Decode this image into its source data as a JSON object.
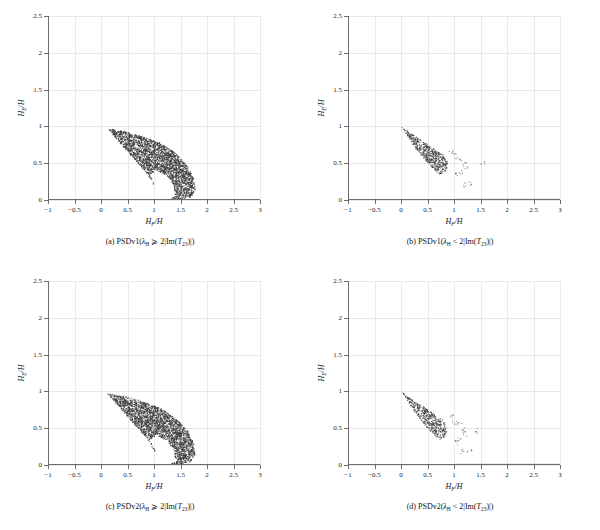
{
  "figure": {
    "panel_count": 4,
    "axes": {
      "xlabel_main": "H",
      "xlabel_sub": "F",
      "xlabel_tail": "/H",
      "ylabel_main": "H",
      "ylabel_sub": "E",
      "ylabel_tail": "/H",
      "xticks": [
        "-1",
        "-0.5",
        "0",
        "0.5",
        "1",
        "1.5",
        "2",
        "2.5",
        "3"
      ],
      "yticks": [
        "0",
        "0.5",
        "1",
        "1.5",
        "2",
        "2.5"
      ],
      "xlim": [
        -1,
        3
      ],
      "ylim": [
        0,
        2.5
      ]
    },
    "colors": {
      "point": "#3a3a3a",
      "axis": "#6d6d6d",
      "grid": "#e9e9e9",
      "background": "#ffffff",
      "text": "#111111"
    },
    "panels": [
      {
        "id": "a",
        "caption_label": "(a)",
        "caption_method": "PSDv1(",
        "caption_lambda": "λ",
        "caption_lambda_sub": "H",
        "caption_relation": " ⩾ 2|Im(",
        "caption_T": "T",
        "caption_T_sub": "23",
        "caption_tail": ")|)",
        "shape": "crescent"
      },
      {
        "id": "b",
        "caption_label": "(b)",
        "caption_method": "PSDv1(",
        "caption_lambda": "λ",
        "caption_lambda_sub": "H",
        "caption_relation": " < 2|Im(",
        "caption_T": "T",
        "caption_T_sub": "23",
        "caption_tail": ")|)",
        "shape": "wedge-with-baseline"
      },
      {
        "id": "c",
        "caption_label": "(c)",
        "caption_method": "PSDv2(",
        "caption_lambda": "λ",
        "caption_lambda_sub": "H",
        "caption_relation": " ⩾ 2|Im(",
        "caption_T": "T",
        "caption_T_sub": "23",
        "caption_tail": ")|)",
        "shape": "crescent"
      },
      {
        "id": "d",
        "caption_label": "(d)",
        "caption_method": "PSDv2(",
        "caption_lambda": "λ",
        "caption_lambda_sub": "H",
        "caption_relation": " < 2|Im(",
        "caption_T": "T",
        "caption_T_sub": "23",
        "caption_tail": ")|)",
        "shape": "wedge-with-baseline"
      }
    ]
  },
  "chart_data": [
    {
      "type": "scatter",
      "panel": "a",
      "title": "(a) PSDv1( λH ⩾ 2|Im(T23)|)",
      "xlabel": "HF/H",
      "ylabel": "HE/H",
      "xlim": [
        -1,
        3
      ],
      "ylim": [
        0,
        2.5
      ],
      "xticks": [
        -1,
        -0.5,
        0,
        0.5,
        1,
        1.5,
        2,
        2.5,
        3
      ],
      "yticks": [
        0,
        0.5,
        1,
        1.5,
        2,
        2.5
      ],
      "grid": true,
      "legend": "none",
      "point_color": "#3a3a3a",
      "cloud_description": "Dense crescent/wing-shaped region; upper boundary runs from (0.12,0.97) rightward sagging to (1.75,0.30); lower-left boundary from (0.12,0.97) down to (1.0,0.0); lower-right lobe bulges to x=1.78 at y=0.10; interior hole (unpopulated lens) centered near (0.95,0.28)",
      "region_hull": [
        [
          0.12,
          0.97
        ],
        [
          0.45,
          0.93
        ],
        [
          0.8,
          0.86
        ],
        [
          1.1,
          0.78
        ],
        [
          1.4,
          0.64
        ],
        [
          1.62,
          0.48
        ],
        [
          1.75,
          0.3
        ],
        [
          1.78,
          0.14
        ],
        [
          1.7,
          0.04
        ],
        [
          1.45,
          0.0
        ],
        [
          1.02,
          0.0
        ],
        [
          1.02,
          0.18
        ],
        [
          0.88,
          0.35
        ],
        [
          0.62,
          0.56
        ],
        [
          0.35,
          0.78
        ]
      ],
      "hole_hull": [
        [
          1.02,
          0.0
        ],
        [
          1.02,
          0.2
        ],
        [
          0.92,
          0.34
        ],
        [
          1.05,
          0.4
        ],
        [
          1.25,
          0.33
        ],
        [
          1.38,
          0.2
        ],
        [
          1.4,
          0.06
        ],
        [
          1.3,
          0.0
        ]
      ],
      "n_points_approx": 9000,
      "x_range_data": [
        0.12,
        1.78
      ],
      "y_range_data": [
        0.0,
        0.97
      ]
    },
    {
      "type": "scatter",
      "panel": "b",
      "title": "(b) PSDv1( λH < 2|Im(T23)|)",
      "xlabel": "HF/H",
      "ylabel": "HE/H",
      "xlim": [
        -1,
        3
      ],
      "ylim": [
        0,
        2.5
      ],
      "xticks": [
        -1,
        -0.5,
        0,
        0.5,
        1,
        1.5,
        2,
        2.5,
        3
      ],
      "yticks": [
        0,
        0.5,
        1,
        1.5,
        2,
        2.5
      ],
      "grid": true,
      "legend": "none",
      "point_color": "#3a3a3a",
      "cloud_description": "Narrow triangular wedge with apex at (0.02,0.99) widening to the right; bounded above by line from (0.02,0.99) to (1.0,0.0) and below by a steeper line; dense core ends near x=0.8; sparse outliers scatter to x=1.55 between y=0.2 and y=0.65; plus a solid horizontal line of points at y=0 spanning x=1.0 to x=3.0",
      "wedge_hull": [
        [
          0.02,
          0.99
        ],
        [
          0.78,
          0.62
        ],
        [
          0.88,
          0.52
        ],
        [
          0.86,
          0.4
        ],
        [
          0.74,
          0.33
        ],
        [
          0.5,
          0.5
        ],
        [
          0.25,
          0.72
        ]
      ],
      "baseline": {
        "y": 0.0,
        "x_start": 1.0,
        "x_end": 3.0
      },
      "outliers": [
        [
          0.95,
          0.66
        ],
        [
          1.02,
          0.6
        ],
        [
          1.1,
          0.57
        ],
        [
          1.18,
          0.5
        ],
        [
          1.22,
          0.44
        ],
        [
          1.12,
          0.38
        ],
        [
          1.05,
          0.33
        ],
        [
          1.18,
          0.2
        ],
        [
          1.33,
          0.22
        ],
        [
          1.55,
          0.5
        ]
      ],
      "n_points_approx": 4000,
      "x_range_data": [
        0.02,
        3.0
      ],
      "y_range_data": [
        0.0,
        0.99
      ]
    },
    {
      "type": "scatter",
      "panel": "c",
      "title": "(c) PSDv2( λH ⩾ 2|Im(T23)|)",
      "xlabel": "HF/H",
      "ylabel": "HE/H",
      "xlim": [
        -1,
        3
      ],
      "ylim": [
        0,
        2.5
      ],
      "xticks": [
        -1,
        -0.5,
        0,
        0.5,
        1,
        1.5,
        2,
        2.5,
        3
      ],
      "yticks": [
        0,
        0.5,
        1,
        1.5,
        2,
        2.5
      ],
      "grid": true,
      "legend": "none",
      "point_color": "#3a3a3a",
      "cloud_description": "Crescent/wing region essentially identical to panel (a); upper boundary from (0.12,0.97) to (1.75,0.30), lower-right lobe to x=1.78, interior unpopulated lens near (0.95,0.28)",
      "region_hull": [
        [
          0.12,
          0.97
        ],
        [
          0.45,
          0.93
        ],
        [
          0.8,
          0.86
        ],
        [
          1.1,
          0.78
        ],
        [
          1.4,
          0.64
        ],
        [
          1.62,
          0.48
        ],
        [
          1.75,
          0.3
        ],
        [
          1.78,
          0.14
        ],
        [
          1.7,
          0.04
        ],
        [
          1.45,
          0.0
        ],
        [
          1.02,
          0.0
        ],
        [
          1.02,
          0.18
        ],
        [
          0.88,
          0.35
        ],
        [
          0.62,
          0.56
        ],
        [
          0.35,
          0.78
        ]
      ],
      "hole_hull": [
        [
          1.02,
          0.0
        ],
        [
          1.02,
          0.2
        ],
        [
          0.92,
          0.34
        ],
        [
          1.05,
          0.4
        ],
        [
          1.25,
          0.33
        ],
        [
          1.38,
          0.2
        ],
        [
          1.4,
          0.06
        ],
        [
          1.3,
          0.0
        ]
      ],
      "n_points_approx": 9000,
      "x_range_data": [
        0.12,
        1.78
      ],
      "y_range_data": [
        0.0,
        0.97
      ]
    },
    {
      "type": "scatter",
      "panel": "d",
      "title": "(d) PSDv2( λH < 2|Im(T23)|)",
      "xlabel": "HF/H",
      "ylabel": "HE/H",
      "xlim": [
        -1,
        3
      ],
      "ylim": [
        0,
        2.5
      ],
      "xticks": [
        -1,
        -0.5,
        0,
        0.5,
        1,
        1.5,
        2,
        2.5,
        3
      ],
      "yticks": [
        0,
        0.5,
        1,
        1.5,
        2,
        2.5
      ],
      "grid": true,
      "legend": "none",
      "point_color": "#3a3a3a",
      "cloud_description": "Narrow triangular wedge identical in character to panel (b); apex at (0.02,0.99), dense core to x=0.8, sparse outliers out to x=1.4; horizontal line of points at y=0 from x=1.0 to x=3.0",
      "wedge_hull": [
        [
          0.02,
          0.99
        ],
        [
          0.78,
          0.62
        ],
        [
          0.88,
          0.52
        ],
        [
          0.86,
          0.4
        ],
        [
          0.74,
          0.33
        ],
        [
          0.5,
          0.5
        ],
        [
          0.25,
          0.72
        ]
      ],
      "baseline": {
        "y": 0.0,
        "x_start": 1.0,
        "x_end": 3.0
      },
      "outliers": [
        [
          0.95,
          0.66
        ],
        [
          1.02,
          0.58
        ],
        [
          1.1,
          0.55
        ],
        [
          1.16,
          0.48
        ],
        [
          1.2,
          0.42
        ],
        [
          1.08,
          0.36
        ],
        [
          1.02,
          0.31
        ],
        [
          1.14,
          0.18
        ],
        [
          1.3,
          0.2
        ],
        [
          1.4,
          0.46
        ]
      ],
      "n_points_approx": 4000,
      "x_range_data": [
        0.02,
        3.0
      ],
      "y_range_data": [
        0.0,
        0.99
      ]
    }
  ]
}
